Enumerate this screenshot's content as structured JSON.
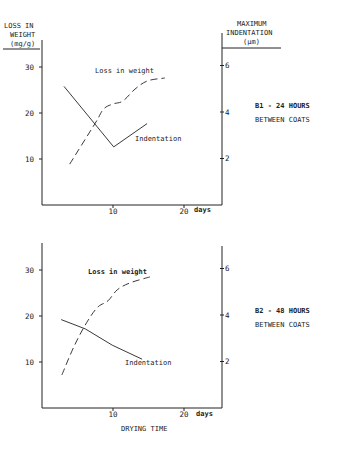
{
  "chart_data": [
    {
      "type": "line",
      "title": "",
      "panel_label": [
        "B1 - 24 HOURS",
        "BETWEEN COATS"
      ],
      "xlabel": "days",
      "xlim": [
        0,
        25
      ],
      "xticks": [
        10,
        20
      ],
      "xtick_labels": [
        "10",
        "20"
      ],
      "x_unit_label": "days",
      "ylabel_left": [
        "LOSS IN",
        "WEIGHT",
        "(mg/g)"
      ],
      "ylim_left": [
        0,
        36
      ],
      "yticks_left": [
        10,
        20,
        30
      ],
      "ytick_labels_left": [
        "10",
        "20",
        "30"
      ],
      "ylabel_right": [
        "MAXIMUM",
        "INDENTATION",
        "(µm)"
      ],
      "ylim_right": [
        0,
        7.2
      ],
      "yticks_right": [
        2,
        4,
        6
      ],
      "ytick_labels_right": [
        "2",
        "4",
        "6"
      ],
      "grid": false,
      "series": [
        {
          "name": "Loss in weight",
          "axis": "left",
          "style": "dashed",
          "x": [
            3.9,
            7.5,
            8.7,
            10.1,
            11.4,
            13.1,
            14.9,
            17.3
          ],
          "y": [
            8.9,
            17.8,
            20.9,
            22.0,
            22.6,
            25.2,
            27.0,
            27.6
          ]
        },
        {
          "name": "Indentation",
          "axis": "right",
          "style": "solid",
          "x": [
            3.1,
            10.1,
            14.8
          ],
          "y": [
            5.1,
            2.5,
            3.5
          ]
        }
      ],
      "annotations": [
        "Loss in weight",
        "Indentation"
      ]
    },
    {
      "type": "line",
      "title": "",
      "panel_label": [
        "B2 - 48 HOURS",
        "BETWEEN COATS"
      ],
      "xlabel": "DRYING TIME",
      "xlim": [
        0,
        25
      ],
      "xticks": [
        10,
        20
      ],
      "xtick_labels": [
        "10",
        "20"
      ],
      "x_unit_label": "days",
      "ylim_left": [
        0,
        36
      ],
      "yticks_left": [
        10,
        20,
        30
      ],
      "ytick_labels_left": [
        "10",
        "20",
        "30"
      ],
      "ylim_right": [
        0,
        7.2
      ],
      "yticks_right": [
        2,
        4,
        6
      ],
      "ytick_labels_right": [
        "2",
        "4",
        "6"
      ],
      "grid": false,
      "series": [
        {
          "name": "Loss in weight",
          "axis": "left",
          "style": "dashed",
          "x": [
            2.8,
            4.6,
            6.5,
            7.9,
            9.3,
            10.6,
            12.4,
            15.2
          ],
          "y": [
            7.2,
            13.7,
            19.1,
            22.0,
            23.3,
            25.7,
            27.2,
            28.5
          ]
        },
        {
          "name": "Indentation",
          "axis": "right",
          "style": "solid",
          "x": [
            2.7,
            6.1,
            9.9,
            14.1
          ],
          "y": [
            3.8,
            3.4,
            2.7,
            2.1
          ]
        }
      ],
      "annotations": [
        "Loss in weight",
        "Indentation"
      ]
    }
  ]
}
